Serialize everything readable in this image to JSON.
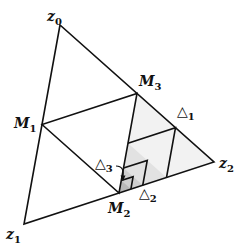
{
  "diagram": {
    "colors": {
      "stroke": "#111111",
      "shade_level1": "#f0f0f0",
      "shade_level2": "#dcdcdc",
      "shade_level3": "#c4c4c4",
      "background": "#ffffff"
    },
    "vertices": {
      "z0": {
        "name": "z",
        "sub": "0",
        "x": 60,
        "y": 25
      },
      "z1": {
        "name": "z",
        "sub": "1",
        "x": 24,
        "y": 224
      },
      "z2": {
        "name": "z",
        "sub": "2",
        "x": 214,
        "y": 162
      },
      "M1": {
        "name": "M",
        "sub": "1",
        "x": 42,
        "y": 124.5
      },
      "M2": {
        "name": "M",
        "sub": "2",
        "x": 119,
        "y": 193
      },
      "M3": {
        "name": "M",
        "sub": "3",
        "x": 137,
        "y": 93.5
      }
    },
    "labels": {
      "z0": {
        "main": "z",
        "sub": "0"
      },
      "z1": {
        "main": "z",
        "sub": "1"
      },
      "z2": {
        "main": "z",
        "sub": "2"
      },
      "M1": {
        "main": "M",
        "sub": "1"
      },
      "M2": {
        "main": "M",
        "sub": "2"
      },
      "M3": {
        "main": "M",
        "sub": "3"
      },
      "delta1": {
        "main": "△",
        "sub": "1"
      },
      "delta2": {
        "main": "△",
        "sub": "2"
      },
      "delta3": {
        "main": "△",
        "sub": "3"
      }
    }
  }
}
